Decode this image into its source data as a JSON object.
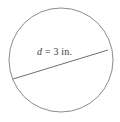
{
  "figure": {
    "kind": "circle-with-diameter",
    "background_color": "#ffffff",
    "stroke_color": "#8c8c8c",
    "text_color": "#3a3a3a",
    "circle": {
      "center_x": 61,
      "center_y": 60,
      "radius": 52,
      "stroke_width": 1
    },
    "diameter_segment": {
      "x1": 13,
      "y1": 79,
      "x2": 108,
      "y2": 50,
      "stroke_width": 1
    },
    "label": {
      "variable": "d",
      "equals": "=",
      "value": "3",
      "unit": "in.",
      "full_text": "d = 3 in."
    }
  }
}
